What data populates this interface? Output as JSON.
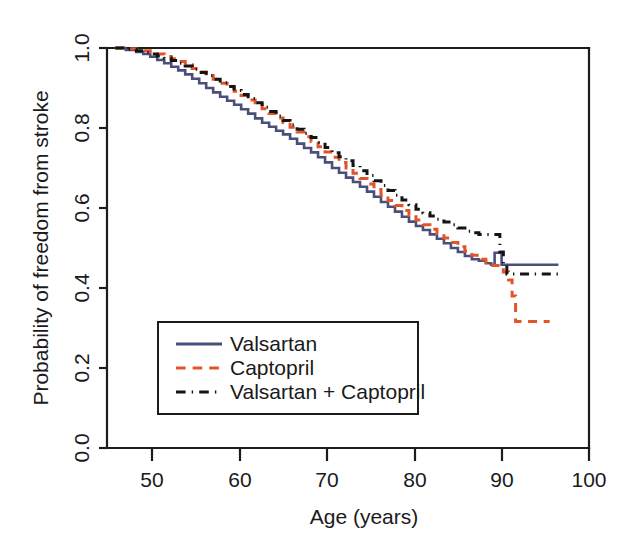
{
  "figure": {
    "background_color": "#ffffff",
    "frame_color": "#1c1c1c"
  },
  "chart_data": {
    "type": "line",
    "title": "",
    "subtitle": "",
    "xlabel": "Age (years)",
    "ylabel": "Probability of freedom from stroke",
    "xlim": [
      45,
      100
    ],
    "ylim": [
      0.0,
      1.0
    ],
    "xticks": [
      50,
      60,
      70,
      80,
      90,
      100
    ],
    "xtick_labels": [
      "50",
      "60",
      "70",
      "80",
      "90",
      "100"
    ],
    "yticks": [
      0.0,
      0.2,
      0.4,
      0.6,
      0.8,
      1.0
    ],
    "ytick_labels": [
      "0.0",
      "0.2",
      "0.4",
      "0.6",
      "0.8",
      "1.0"
    ],
    "grid": false,
    "legend_position": "lower-left-inside",
    "legend_entries": [
      "Valsartan",
      "Captopril",
      "Valsartan + Captopril"
    ],
    "series": [
      {
        "name": "Valsartan",
        "color": "#4a4f7a",
        "dash": "solid",
        "linewidth": 2.6,
        "x": [
          45.8,
          47.0,
          48.2,
          49.0,
          49.8,
          50.6,
          51.4,
          52.2,
          53.0,
          53.8,
          54.6,
          55.4,
          56.2,
          57.0,
          57.8,
          58.6,
          59.4,
          60.2,
          61.0,
          61.8,
          62.6,
          63.4,
          64.2,
          65.0,
          65.8,
          66.6,
          67.4,
          68.2,
          69.0,
          69.8,
          70.6,
          71.4,
          72.2,
          73.0,
          73.8,
          74.6,
          75.4,
          76.2,
          77.0,
          77.8,
          78.6,
          79.4,
          80.2,
          81.0,
          81.8,
          82.6,
          83.4,
          84.2,
          85.0,
          85.8,
          86.6,
          87.4,
          88.2,
          88.8,
          89.2,
          89.6,
          90.0,
          90.4,
          96.5
        ],
        "y": [
          1.0,
          0.995,
          0.99,
          0.985,
          0.978,
          0.97,
          0.962,
          0.953,
          0.944,
          0.934,
          0.923,
          0.912,
          0.9,
          0.889,
          0.878,
          0.868,
          0.858,
          0.847,
          0.836,
          0.824,
          0.813,
          0.803,
          0.793,
          0.784,
          0.773,
          0.761,
          0.75,
          0.739,
          0.727,
          0.714,
          0.7,
          0.688,
          0.676,
          0.665,
          0.653,
          0.641,
          0.628,
          0.615,
          0.603,
          0.591,
          0.578,
          0.566,
          0.555,
          0.545,
          0.534,
          0.523,
          0.512,
          0.5,
          0.49,
          0.48,
          0.472,
          0.468,
          0.462,
          0.458,
          0.488,
          0.488,
          0.458,
          0.458,
          0.458
        ]
      },
      {
        "name": "Captopril",
        "color": "#e2542a",
        "dash": "dashed",
        "linewidth": 3.0,
        "x": [
          45.8,
          47.0,
          48.2,
          49.0,
          49.8,
          50.6,
          51.4,
          52.2,
          53.0,
          53.8,
          54.6,
          55.4,
          56.2,
          57.0,
          57.8,
          58.6,
          59.4,
          60.2,
          61.0,
          61.8,
          62.6,
          63.4,
          64.2,
          65.0,
          65.8,
          66.6,
          67.4,
          68.2,
          69.0,
          69.8,
          70.6,
          71.4,
          72.2,
          73.0,
          73.8,
          74.6,
          75.4,
          76.2,
          77.0,
          77.8,
          78.6,
          79.4,
          80.2,
          81.0,
          81.8,
          82.6,
          83.4,
          84.2,
          85.0,
          85.8,
          86.6,
          87.4,
          88.2,
          89.0,
          89.6,
          90.2,
          90.8,
          91.2,
          91.6,
          95.5
        ],
        "y": [
          1.0,
          0.998,
          0.996,
          0.993,
          0.99,
          0.985,
          0.979,
          0.973,
          0.966,
          0.958,
          0.949,
          0.94,
          0.931,
          0.922,
          0.912,
          0.902,
          0.892,
          0.881,
          0.87,
          0.859,
          0.848,
          0.836,
          0.825,
          0.814,
          0.802,
          0.79,
          0.778,
          0.766,
          0.753,
          0.74,
          0.727,
          0.714,
          0.7,
          0.687,
          0.674,
          0.66,
          0.646,
          0.632,
          0.619,
          0.606,
          0.594,
          0.582,
          0.57,
          0.558,
          0.547,
          0.536,
          0.525,
          0.514,
          0.503,
          0.492,
          0.482,
          0.472,
          0.464,
          0.456,
          0.45,
          0.44,
          0.42,
          0.38,
          0.316,
          0.316
        ]
      },
      {
        "name": "Valsartan + Captopril",
        "color": "#141414",
        "dash": "dashdot",
        "linewidth": 3.0,
        "x": [
          45.8,
          47.0,
          48.2,
          49.0,
          49.8,
          50.6,
          51.4,
          52.2,
          53.0,
          53.8,
          54.6,
          55.4,
          56.2,
          57.0,
          57.8,
          58.6,
          59.4,
          60.2,
          61.0,
          61.8,
          62.6,
          63.4,
          64.2,
          65.0,
          65.8,
          66.6,
          67.4,
          68.2,
          69.0,
          69.8,
          70.6,
          71.4,
          72.2,
          73.0,
          73.8,
          74.6,
          75.4,
          76.2,
          77.0,
          77.8,
          78.6,
          79.4,
          80.2,
          81.0,
          81.8,
          82.6,
          83.4,
          84.2,
          85.0,
          85.8,
          86.6,
          87.4,
          88.0,
          88.6,
          89.2,
          89.8,
          90.2,
          90.6,
          96.8
        ],
        "y": [
          1.0,
          0.997,
          0.993,
          0.989,
          0.985,
          0.98,
          0.975,
          0.969,
          0.962,
          0.955,
          0.947,
          0.939,
          0.931,
          0.922,
          0.913,
          0.904,
          0.894,
          0.884,
          0.874,
          0.863,
          0.852,
          0.841,
          0.83,
          0.819,
          0.808,
          0.797,
          0.786,
          0.776,
          0.764,
          0.751,
          0.738,
          0.728,
          0.718,
          0.706,
          0.693,
          0.681,
          0.668,
          0.656,
          0.644,
          0.632,
          0.62,
          0.608,
          0.597,
          0.588,
          0.58,
          0.572,
          0.565,
          0.558,
          0.55,
          0.542,
          0.538,
          0.534,
          0.534,
          0.534,
          0.534,
          0.49,
          0.46,
          0.435,
          0.435
        ]
      }
    ]
  },
  "legend": {
    "items": [
      {
        "label": "Valsartan",
        "color": "#4a4f7a",
        "style": "solid"
      },
      {
        "label": "Captopril",
        "color": "#e2542a",
        "style": "dashed"
      },
      {
        "label": "Valsartan + Captopril",
        "color": "#141414",
        "style": "dashdot"
      }
    ]
  },
  "axes": {
    "x_title": "Age (years)",
    "y_title": "Probability of freedom from stroke",
    "x_tick_labels": [
      "50",
      "60",
      "70",
      "80",
      "90",
      "100"
    ],
    "y_tick_labels": [
      "0.0",
      "0.2",
      "0.4",
      "0.6",
      "0.8",
      "1.0"
    ]
  }
}
